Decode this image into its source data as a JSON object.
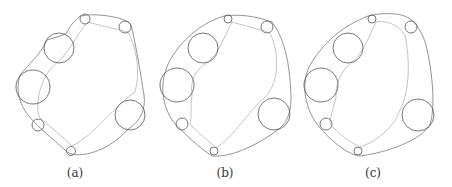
{
  "panels": [
    {
      "label": "(a)",
      "label_x": 75,
      "circles": [
        {
          "cx": 85,
          "cy": 19,
          "r": 5
        },
        {
          "cx": 125,
          "cy": 27,
          "r": 6
        },
        {
          "cx": 59,
          "cy": 48,
          "r": 15
        },
        {
          "cx": 33,
          "cy": 87,
          "r": 17
        },
        {
          "cx": 38,
          "cy": 125,
          "r": 6
        },
        {
          "cx": 71,
          "cy": 151,
          "r": 4.5
        },
        {
          "cx": 130,
          "cy": 115,
          "r": 15
        }
      ],
      "outer_path": "M80,16 C70,24 66,34 66,34 L47,40 C40,55 28,65 20,75 C15,90 20,105 28,115 C40,130 55,140 67,152 C80,160 110,150 127,130 C140,122 146,110 144,95 C140,70 135,40 131,25 C125,16 95,14 88,15 Z",
      "inner_path": "M88,22 C80,30 70,50 60,60 C50,68 45,75 40,90 C38,100 36,110 40,118 C55,130 65,140 72,146 C95,135 115,105 135,92 C140,75 138,50 128,32 C110,28 95,24 88,22 Z"
    },
    {
      "label": "(b)",
      "label_x": 225,
      "circles": [
        {
          "cx": 228,
          "cy": 19,
          "r": 4
        },
        {
          "cx": 267,
          "cy": 27,
          "r": 6
        },
        {
          "cx": 203,
          "cy": 48,
          "r": 15
        },
        {
          "cx": 177,
          "cy": 85,
          "r": 17
        },
        {
          "cx": 182,
          "cy": 124,
          "r": 6
        },
        {
          "cx": 214,
          "cy": 151,
          "r": 4
        },
        {
          "cx": 274,
          "cy": 114,
          "r": 16
        }
      ],
      "outer_path": "M224,16 C205,22 185,35 170,60 C160,80 160,100 172,120 C185,135 200,148 212,156 C235,158 265,140 280,128 C292,118 292,100 290,80 C288,55 282,35 272,22 C255,16 240,14 224,16 Z",
      "inner_path": "M232,22 C225,35 218,55 208,62 C195,70 190,80 192,95 C190,110 192,118 190,124 C200,135 208,140 216,148 C235,135 250,110 262,100 C280,85 280,55 270,33 C255,28 242,25 232,22 Z"
    },
    {
      "label": "(c)",
      "label_x": 373,
      "circles": [
        {
          "cx": 372,
          "cy": 19,
          "r": 4
        },
        {
          "cx": 411,
          "cy": 27,
          "r": 6
        },
        {
          "cx": 348,
          "cy": 48,
          "r": 15
        },
        {
          "cx": 321,
          "cy": 85,
          "r": 17
        },
        {
          "cx": 326,
          "cy": 124,
          "r": 6
        },
        {
          "cx": 358,
          "cy": 151,
          "r": 4
        },
        {
          "cx": 418,
          "cy": 115,
          "r": 16
        }
      ],
      "outer_path": "M368,16 C345,25 325,40 310,65 C300,85 305,110 320,128 C335,145 350,155 360,156 C390,152 420,140 430,125 C436,105 432,70 426,45 C420,25 410,15 395,14 C385,13 375,14 368,16 Z",
      "inner_path": "M376,22 C370,35 362,55 352,62 C340,72 335,85 336,98 C332,112 330,118 330,124 C340,135 350,142 360,147 C380,140 395,125 400,110 C410,90 410,60 405,35 C398,24 385,20 376,22 Z"
    }
  ]
}
